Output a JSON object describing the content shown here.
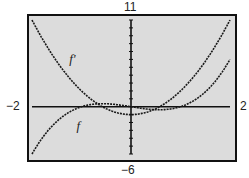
{
  "chart_data": {
    "type": "line",
    "title": "",
    "xlabel": "",
    "ylabel": "",
    "xlim": [
      -2,
      2
    ],
    "ylim": [
      -6,
      11
    ],
    "window_labels": {
      "xmin": "−2",
      "xmax": "2",
      "ymin": "−6",
      "ymax": "11"
    },
    "grid": false,
    "y_tick_step": 1,
    "series": [
      {
        "name": "f'",
        "expression": "3x^2 - 1",
        "x": [
          -2,
          -1.5,
          -1,
          -0.577,
          0,
          0.577,
          1,
          1.5,
          2
        ],
        "values": [
          11,
          5.75,
          2,
          0,
          -1,
          0,
          2,
          5.75,
          11
        ]
      },
      {
        "name": "f",
        "expression": "x^3 - x",
        "x": [
          -2,
          -1.5,
          -1,
          -0.577,
          0,
          0.577,
          1,
          1.5,
          2
        ],
        "values": [
          -6,
          -1.875,
          0,
          0.385,
          0,
          -0.385,
          0,
          1.875,
          6
        ]
      }
    ],
    "annotations": [
      {
        "text": "f'",
        "x": -1.25,
        "y": 5.5
      },
      {
        "text": "f",
        "x": -1.1,
        "y": -3
      }
    ]
  },
  "colors": {
    "plot_bg": "#dcdcdc",
    "frame": "#111111",
    "curve": "#1a1a1a"
  }
}
